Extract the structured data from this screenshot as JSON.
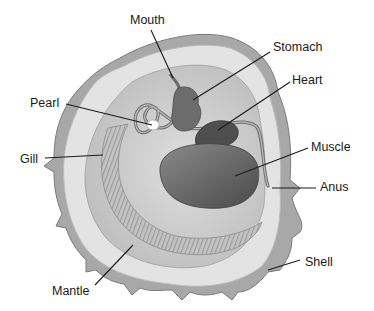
{
  "diagram": {
    "colors": {
      "background": "#ffffff",
      "shell_outer": "#9a9a9a",
      "shell_rim": "#d9d9d9",
      "mantle": "#e8e8e8",
      "interior": "#cfcfcf",
      "gill": "#b5b5b5",
      "organ_dark": "#5a5a5a",
      "organ_mid": "#7a7a7a",
      "pearl": "#ffffff",
      "label_text": "#1a1a1a",
      "leader_line": "#1a1a1a"
    },
    "labels": [
      {
        "id": "mouth",
        "text": "Mouth",
        "x": 130,
        "y": 14,
        "line": [
          151,
          30,
          173,
          78
        ]
      },
      {
        "id": "stomach",
        "text": "Stomach",
        "x": 273,
        "y": 41,
        "line": [
          270,
          52,
          193,
          100
        ]
      },
      {
        "id": "heart",
        "text": "Heart",
        "x": 292,
        "y": 74,
        "line": [
          290,
          82,
          218,
          130
        ]
      },
      {
        "id": "pearl",
        "text": "Pearl",
        "x": 30,
        "y": 97,
        "line": [
          66,
          104,
          152,
          125
        ]
      },
      {
        "id": "muscle",
        "text": "Muscle",
        "x": 311,
        "y": 141,
        "line": [
          308,
          148,
          235,
          176
        ]
      },
      {
        "id": "gill",
        "text": "Gill",
        "x": 20,
        "y": 153,
        "line": [
          45,
          158,
          103,
          155
        ]
      },
      {
        "id": "anus",
        "text": "Anus",
        "x": 320,
        "y": 181,
        "line": [
          316,
          188,
          272,
          188
        ]
      },
      {
        "id": "shell",
        "text": "Shell",
        "x": 305,
        "y": 256,
        "line": [
          300,
          260,
          268,
          270
        ]
      },
      {
        "id": "mantle",
        "text": "Mantle",
        "x": 52,
        "y": 285,
        "line": [
          95,
          285,
          133,
          245
        ]
      }
    ]
  }
}
